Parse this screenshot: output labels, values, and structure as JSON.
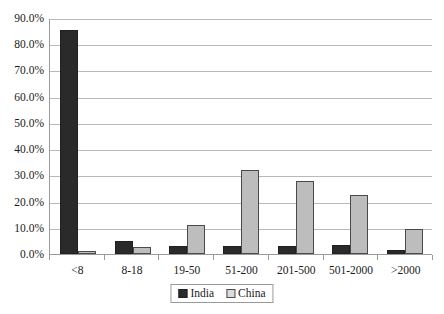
{
  "chart_data": {
    "type": "bar",
    "title": "",
    "xlabel": "",
    "ylabel": "",
    "ylim": [
      0,
      90
    ],
    "grid": true,
    "legend_position": "bottom",
    "categories": [
      "<8",
      "8-18",
      "19-50",
      "51-200",
      "201-500",
      "501-2000",
      ">2000"
    ],
    "y_ticks": [
      "0.0%",
      "10.0%",
      "20.0%",
      "30.0%",
      "40.0%",
      "50.0%",
      "60.0%",
      "70.0%",
      "80.0%",
      "90.0%"
    ],
    "y_tick_values": [
      0,
      10,
      20,
      30,
      40,
      50,
      60,
      70,
      80,
      90
    ],
    "series": [
      {
        "name": "India",
        "color": "#2a2a2a",
        "values": [
          85.5,
          5.0,
          3.0,
          3.2,
          3.2,
          3.5,
          1.5
        ]
      },
      {
        "name": "China",
        "color": "#bdbdbd",
        "values": [
          1.0,
          2.5,
          11.0,
          32.0,
          28.0,
          22.5,
          9.5
        ]
      }
    ]
  }
}
